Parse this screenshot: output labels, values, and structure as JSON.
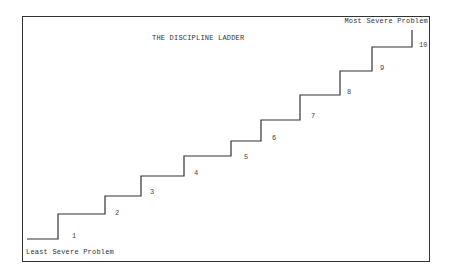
{
  "diagram": {
    "title": "THE DISCIPLINE LADDER",
    "top_label": "Most Severe Problem",
    "bottom_label": "Least Severe Problem",
    "line_color": "#333333",
    "steps": [
      {
        "number": "1",
        "x1": 27,
        "x2": 58,
        "y": 239,
        "label_x": 72,
        "label_y": 232
      },
      {
        "number": "2",
        "x1": 58,
        "x2": 105,
        "y": 214,
        "label_x": 115,
        "label_y": 209
      },
      {
        "number": "3",
        "x1": 105,
        "x2": 141,
        "y": 196,
        "label_x": 150,
        "label_y": 188
      },
      {
        "number": "4",
        "x1": 141,
        "x2": 184,
        "y": 176,
        "label_x": 194,
        "label_y": 169
      },
      {
        "number": "5",
        "x1": 184,
        "x2": 231,
        "y": 156,
        "label_x": 244,
        "label_y": 153
      },
      {
        "number": "6",
        "x1": 231,
        "x2": 261,
        "y": 141,
        "label_x": 272,
        "label_y": 134
      },
      {
        "number": "7",
        "x1": 261,
        "x2": 300,
        "y": 120,
        "label_x": 311,
        "label_y": 112
      },
      {
        "number": "8",
        "x1": 300,
        "x2": 340,
        "y": 95,
        "label_x": 347,
        "label_y": 88
      },
      {
        "number": "9",
        "x1": 340,
        "x2": 372,
        "y": 71,
        "label_x": 380,
        "label_y": 64
      },
      {
        "number": "10",
        "x1": 372,
        "x2": 412,
        "y": 47,
        "label_x": 419,
        "label_y": 41
      }
    ],
    "top_riser_end_y": 30
  }
}
